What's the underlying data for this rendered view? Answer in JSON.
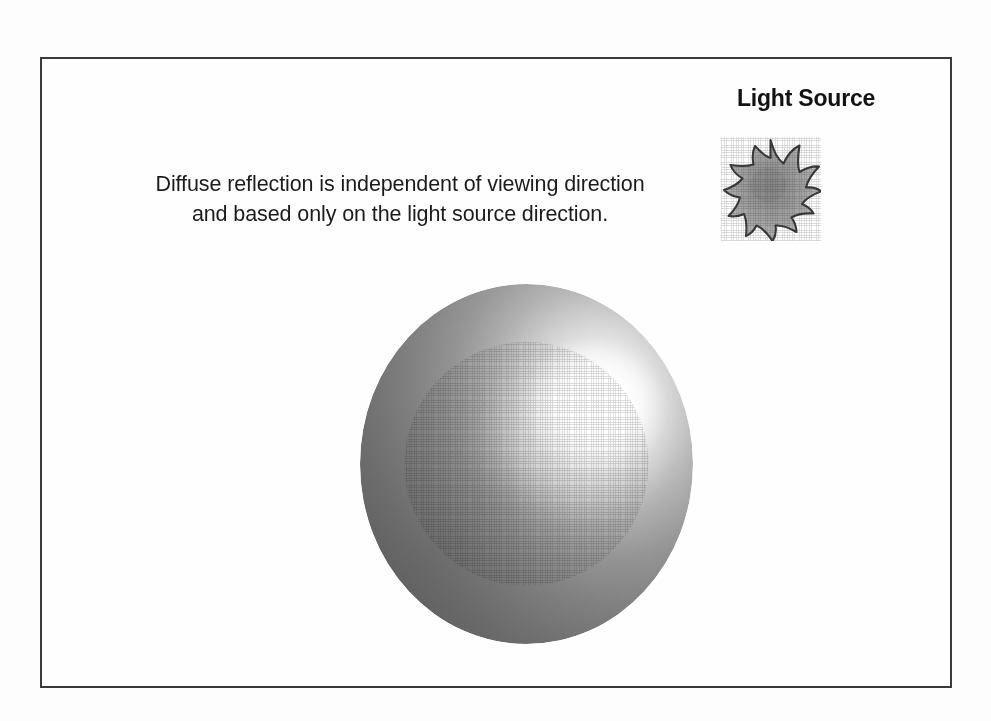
{
  "slide": {
    "background_color": "#fdfdfd",
    "frame_color": "#3a3a3c"
  },
  "caption": {
    "line1": "Diffuse reflection is independent of viewing direction",
    "line2": "and based only on the light source direction.",
    "text_color": "#1c1c1c"
  },
  "light_source": {
    "label": "Light Source",
    "label_color": "#121212",
    "icon_name": "sun-starburst-icon",
    "icon_points": 10,
    "icon_fill_center": "#8d8d8d",
    "icon_fill_edge": "#b4b4b4",
    "icon_outline": "#3d3d3d"
  },
  "sphere": {
    "name": "diffuse-shaded-sphere",
    "highlight_color": "#ffffff",
    "midtone_color": "#9a9a9a",
    "shadow_color": "#565656",
    "terminator_color": "#6e6e6e",
    "highlight_position": "upper-right",
    "diameter_px": 333
  }
}
